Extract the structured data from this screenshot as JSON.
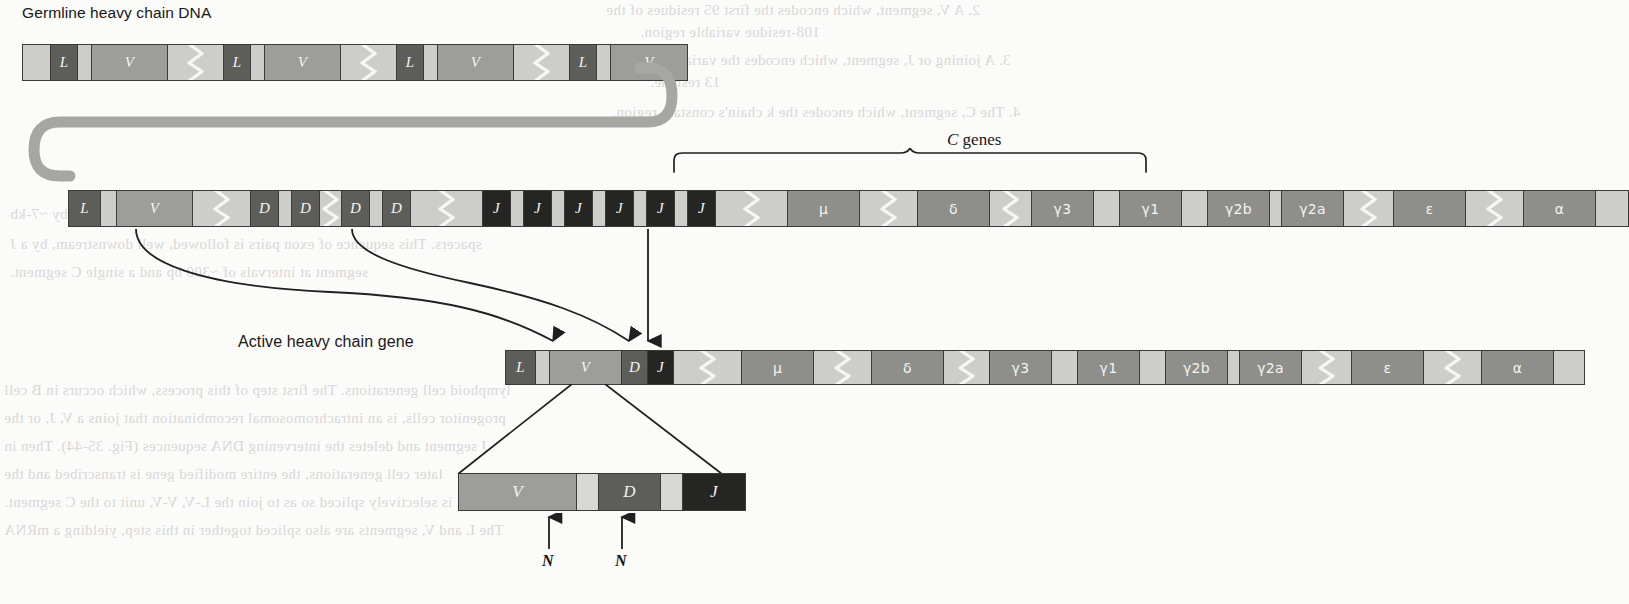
{
  "figure": {
    "title_germline": "Germline heavy chain DNA",
    "title_active": "Active heavy chain gene",
    "c_genes_label_italic": "C",
    "c_genes_label_rest": " genes"
  },
  "colors": {
    "background": "#fbfbfa",
    "outline": "#3a3a3a",
    "spacer_light": "#cdcdc9",
    "v_segment": "#9d9d99",
    "d_segment": "#5d5d5a",
    "j_segment": "#252524",
    "l_segment": "#5d5d5a",
    "c_gene": "#8e8e8a",
    "n_region": "#d7d7d3",
    "loop_gray": "#a6a6a2",
    "text_on_segment": "#f4f4f2",
    "label_text": "#171717"
  },
  "germline_row": {
    "name": "germline-heavy-chain-dna",
    "segments": [
      {
        "label": "",
        "fill": "f-light",
        "w": 28,
        "zig": false
      },
      {
        "label": "L",
        "fill": "f-dark",
        "w": 27,
        "zig": false
      },
      {
        "label": "",
        "fill": "f-light",
        "w": 14,
        "zig": false
      },
      {
        "label": "V",
        "fill": "f-mid",
        "w": 76,
        "zig": false
      },
      {
        "label": "",
        "fill": "f-light",
        "w": 56,
        "zig": true
      },
      {
        "label": "L",
        "fill": "f-dark",
        "w": 27,
        "zig": false
      },
      {
        "label": "",
        "fill": "f-light",
        "w": 14,
        "zig": false
      },
      {
        "label": "V",
        "fill": "f-mid",
        "w": 76,
        "zig": false
      },
      {
        "label": "",
        "fill": "f-light",
        "w": 56,
        "zig": true
      },
      {
        "label": "L",
        "fill": "f-dark",
        "w": 27,
        "zig": false
      },
      {
        "label": "",
        "fill": "f-light",
        "w": 14,
        "zig": false
      },
      {
        "label": "V",
        "fill": "f-mid",
        "w": 76,
        "zig": false
      },
      {
        "label": "",
        "fill": "f-light",
        "w": 56,
        "zig": true
      },
      {
        "label": "L",
        "fill": "f-dark",
        "w": 27,
        "zig": false
      },
      {
        "label": "",
        "fill": "f-light",
        "w": 14,
        "zig": false
      },
      {
        "label": "V",
        "fill": "f-mid",
        "w": 76,
        "zig": false
      }
    ]
  },
  "rearrangement_row": {
    "name": "rearrangement-locus-row",
    "segments": [
      {
        "label": "L",
        "fill": "f-dark",
        "w": 32,
        "zig": false
      },
      {
        "label": "",
        "fill": "f-light",
        "w": 16,
        "zig": false
      },
      {
        "label": "V",
        "fill": "f-mid",
        "w": 76,
        "zig": false
      },
      {
        "label": "",
        "fill": "f-light",
        "w": 58,
        "zig": true
      },
      {
        "label": "D",
        "fill": "f-dark",
        "w": 28,
        "zig": false
      },
      {
        "label": "",
        "fill": "f-light",
        "w": 13,
        "zig": false
      },
      {
        "label": "D",
        "fill": "f-dark",
        "w": 28,
        "zig": false
      },
      {
        "label": "",
        "fill": "f-light",
        "w": 22,
        "zig": true
      },
      {
        "label": "D",
        "fill": "f-dark",
        "w": 28,
        "zig": false
      },
      {
        "label": "",
        "fill": "f-light",
        "w": 13,
        "zig": false
      },
      {
        "label": "D",
        "fill": "f-dark",
        "w": 28,
        "zig": false
      },
      {
        "label": "",
        "fill": "f-light",
        "w": 72,
        "zig": true
      },
      {
        "label": "J",
        "fill": "f-black",
        "w": 28,
        "zig": false
      },
      {
        "label": "",
        "fill": "f-light",
        "w": 13,
        "zig": false
      },
      {
        "label": "J",
        "fill": "f-black",
        "w": 28,
        "zig": false
      },
      {
        "label": "",
        "fill": "f-light",
        "w": 13,
        "zig": false
      },
      {
        "label": "J",
        "fill": "f-black",
        "w": 28,
        "zig": false
      },
      {
        "label": "",
        "fill": "f-light",
        "w": 13,
        "zig": false
      },
      {
        "label": "J",
        "fill": "f-black",
        "w": 28,
        "zig": false
      },
      {
        "label": "",
        "fill": "f-light",
        "w": 13,
        "zig": false
      },
      {
        "label": "J",
        "fill": "f-black",
        "w": 28,
        "zig": false
      },
      {
        "label": "",
        "fill": "f-light",
        "w": 13,
        "zig": false
      },
      {
        "label": "J",
        "fill": "f-black",
        "w": 28,
        "zig": false
      },
      {
        "label": "",
        "fill": "f-light",
        "w": 72,
        "zig": true
      },
      {
        "label": "μ",
        "fill": "f-cmid",
        "w": 72,
        "zig": false,
        "greek": true
      },
      {
        "label": "",
        "fill": "f-light",
        "w": 58,
        "zig": true
      },
      {
        "label": "δ",
        "fill": "f-cmid",
        "w": 72,
        "zig": false,
        "greek": true
      },
      {
        "label": "",
        "fill": "f-light",
        "w": 42,
        "zig": true
      },
      {
        "label": "γ3",
        "fill": "f-cmid",
        "w": 62,
        "zig": false,
        "greek": true
      },
      {
        "label": "",
        "fill": "f-light",
        "w": 26,
        "zig": false
      },
      {
        "label": "γ1",
        "fill": "f-cmid",
        "w": 62,
        "zig": false,
        "greek": true
      },
      {
        "label": "",
        "fill": "f-light",
        "w": 26,
        "zig": false
      },
      {
        "label": "γ2b",
        "fill": "f-cmid",
        "w": 62,
        "zig": false,
        "greek": true
      },
      {
        "label": "",
        "fill": "f-light",
        "w": 12,
        "zig": false
      },
      {
        "label": "γ2a",
        "fill": "f-cmid",
        "w": 62,
        "zig": false,
        "greek": true
      },
      {
        "label": "",
        "fill": "f-light",
        "w": 50,
        "zig": true
      },
      {
        "label": "ε",
        "fill": "f-cmid",
        "w": 72,
        "zig": false,
        "greek": true
      },
      {
        "label": "",
        "fill": "f-light",
        "w": 58,
        "zig": true
      },
      {
        "label": "α",
        "fill": "f-cmid",
        "w": 72,
        "zig": false,
        "greek": true
      },
      {
        "label": "",
        "fill": "f-light",
        "w": 32,
        "zig": false
      }
    ]
  },
  "active_row": {
    "name": "active-heavy-chain-gene-row",
    "segments": [
      {
        "label": "L",
        "fill": "f-dark",
        "w": 30,
        "zig": false
      },
      {
        "label": "",
        "fill": "f-light",
        "w": 14,
        "zig": false
      },
      {
        "label": "V",
        "fill": "f-mid",
        "w": 72,
        "zig": false
      },
      {
        "label": "D",
        "fill": "f-dark",
        "w": 26,
        "zig": false
      },
      {
        "label": "J",
        "fill": "f-black",
        "w": 26,
        "zig": false
      },
      {
        "label": "",
        "fill": "f-light",
        "w": 68,
        "zig": true
      },
      {
        "label": "μ",
        "fill": "f-cmid",
        "w": 72,
        "zig": false,
        "greek": true
      },
      {
        "label": "",
        "fill": "f-light",
        "w": 58,
        "zig": true
      },
      {
        "label": "δ",
        "fill": "f-cmid",
        "w": 72,
        "zig": false,
        "greek": true
      },
      {
        "label": "",
        "fill": "f-light",
        "w": 46,
        "zig": true
      },
      {
        "label": "γ3",
        "fill": "f-cmid",
        "w": 62,
        "zig": false,
        "greek": true
      },
      {
        "label": "",
        "fill": "f-light",
        "w": 26,
        "zig": false
      },
      {
        "label": "γ1",
        "fill": "f-cmid",
        "w": 62,
        "zig": false,
        "greek": true
      },
      {
        "label": "",
        "fill": "f-light",
        "w": 26,
        "zig": false
      },
      {
        "label": "γ2b",
        "fill": "f-cmid",
        "w": 62,
        "zig": false,
        "greek": true
      },
      {
        "label": "",
        "fill": "f-light",
        "w": 12,
        "zig": false
      },
      {
        "label": "γ2a",
        "fill": "f-cmid",
        "w": 62,
        "zig": false,
        "greek": true
      },
      {
        "label": "",
        "fill": "f-light",
        "w": 50,
        "zig": true
      },
      {
        "label": "ε",
        "fill": "f-cmid",
        "w": 72,
        "zig": false,
        "greek": true
      },
      {
        "label": "",
        "fill": "f-light",
        "w": 58,
        "zig": true
      },
      {
        "label": "α",
        "fill": "f-cmid",
        "w": 72,
        "zig": false,
        "greek": true
      },
      {
        "label": "",
        "fill": "f-light",
        "w": 30,
        "zig": false
      }
    ]
  },
  "detail_row": {
    "name": "vdj-junction-detail",
    "segments": [
      {
        "label": "V",
        "fill": "f-mid",
        "w": 118
      },
      {
        "label": "",
        "fill": "f-vlight",
        "w": 22
      },
      {
        "label": "D",
        "fill": "f-dark",
        "w": 62
      },
      {
        "label": "",
        "fill": "f-vlight",
        "w": 22
      },
      {
        "label": "J",
        "fill": "f-black",
        "w": 62
      }
    ],
    "n_labels": [
      "N",
      "N"
    ]
  },
  "ghost_text": [
    {
      "t": "2. A V, segment, which encodes the first 95 residues of the",
      "x": 606,
      "y": 2,
      "s": 15
    },
    {
      "t": "108-residue variable region.",
      "x": 640,
      "y": 24,
      "s": 15
    },
    {
      "t": "3. A joining or J, segment, which encodes the variable region",
      "x": 620,
      "y": 52,
      "s": 15
    },
    {
      "t": "13 residue.",
      "x": 650,
      "y": 74,
      "s": 15
    },
    {
      "t": "4. The C, segment, which encodes the k chain's constant region.",
      "x": 612,
      "y": 104,
      "s": 15
    },
    {
      "t": "separated by introns, with the V-V, units separated from each other by ~7-kb",
      "x": 10,
      "y": 206,
      "s": 15
    },
    {
      "t": "spacers. This sequence of exon pairs is followed, well downstream, by a J",
      "x": 10,
      "y": 236,
      "s": 15
    },
    {
      "t": "segment at intervals of ~300 bp and a single C segment.",
      "x": 10,
      "y": 264,
      "s": 15
    },
    {
      "t": "lymphoid cell generations. The first step of this process, which occurs in B cell",
      "x": 4,
      "y": 382,
      "s": 15
    },
    {
      "t": "progenitor cells, is an intrachromosomal recombination that joins a V, J, or the",
      "x": 4,
      "y": 410,
      "s": 15
    },
    {
      "t": "J segment and deletes the intervening DNA sequences (Fig. 35-44). Then in",
      "x": 4,
      "y": 438,
      "s": 15
    },
    {
      "t": "later cell generations, the entire modified gene is transcribed and the",
      "x": 4,
      "y": 466,
      "s": 15
    },
    {
      "t": "transcript is selectively spliced so as to join the L-V, V-V, unit to the C segment.",
      "x": 4,
      "y": 494,
      "s": 15
    },
    {
      "t": "The L and V, segments are also spliced together in this step, yielding a mRNA",
      "x": 4,
      "y": 522,
      "s": 15
    }
  ]
}
